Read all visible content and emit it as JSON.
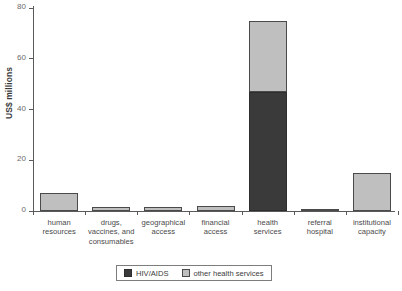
{
  "chart_data": {
    "type": "bar",
    "stacked": true,
    "title": "",
    "subtitle": "",
    "xlabel": "",
    "ylabel": "US$ millions",
    "ylim": [
      0,
      80
    ],
    "yticks": [
      0,
      20,
      40,
      60,
      80
    ],
    "ytick_labels": [
      "0",
      "20",
      "40",
      "60",
      "80"
    ],
    "grid": false,
    "legend_position": "bottom-center",
    "categories": [
      "human\nresources",
      "drugs,\nvaccines, and\nconsumables",
      "geographical\naccess",
      "financial\naccess",
      "health\nservices",
      "referral\nhospital",
      "institutional\ncapacity"
    ],
    "series": [
      {
        "name": "HIV/AIDS",
        "color": "#3a3a3a",
        "values": [
          0,
          0,
          0,
          0,
          47,
          0,
          0
        ]
      },
      {
        "name": "other health services",
        "color": "#bfbfbf",
        "values": [
          7,
          1.5,
          1.5,
          2,
          28,
          0.5,
          15
        ]
      }
    ],
    "totals": [
      7,
      1.5,
      1.5,
      2,
      75,
      0.5,
      15
    ]
  },
  "legend": {
    "items": [
      {
        "label": "HIV/AIDS",
        "color": "#3a3a3a"
      },
      {
        "label": "other health services",
        "color": "#bfbfbf"
      }
    ]
  },
  "axis": {
    "y_title": "US$ millions"
  }
}
